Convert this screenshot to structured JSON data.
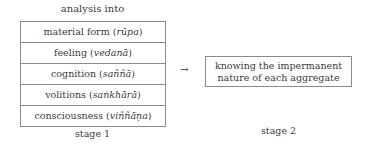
{
  "stage1": {
    "title": "analysis into",
    "aggregates": [
      {
        "english": "material form",
        "pali": "rūpa"
      },
      {
        "english": "feeling",
        "pali": "vedanā"
      },
      {
        "english": "cognition",
        "pali": "saññā"
      },
      {
        "english": "volitions",
        "pali": "saṅkhārā"
      },
      {
        "english": "consciousness",
        "pali": "viññāṇa"
      }
    ],
    "label": "stage 1"
  },
  "arrow": "→",
  "stage2": {
    "box_line1": "knowing the impermanent",
    "box_line2": "nature of each aggregate",
    "label": "stage 2"
  }
}
